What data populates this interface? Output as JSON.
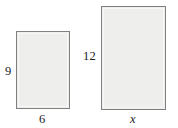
{
  "figure": {
    "background_color": "#ffffff",
    "stroke_color": "#808080",
    "fill_color": "#eeeeec",
    "text_color": "#1a1a1a",
    "shapes": [
      {
        "name": "small-rectangle",
        "height_label": "9",
        "width_label": "6"
      },
      {
        "name": "large-rectangle",
        "height_label": "12",
        "width_label": "x"
      }
    ]
  },
  "chart_data": {
    "type": "diagram",
    "title": "",
    "items": [
      {
        "label": "small rectangle",
        "width": 6,
        "height": 9,
        "width_label": "6",
        "height_label": "9",
        "width_label_position": "bottom-center",
        "height_label_position": "left-middle",
        "px": {
          "x": 16,
          "y": 31,
          "w": 54,
          "h": 78
        }
      },
      {
        "label": "large rectangle",
        "width": null,
        "height": 12,
        "width_label": "x",
        "height_label": "12",
        "width_label_position": "bottom-center",
        "height_label_position": "left-middle",
        "px": {
          "x": 101,
          "y": 6,
          "w": 65,
          "h": 104
        }
      }
    ]
  }
}
